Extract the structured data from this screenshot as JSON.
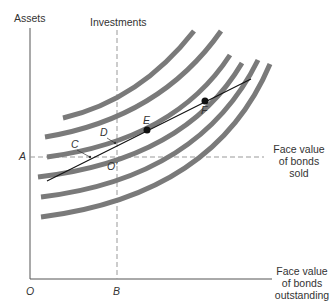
{
  "diagram": {
    "y_axis_label": "Assets",
    "investments_label": "Investments",
    "x_axis_label_lines": [
      "Face value",
      "of bonds",
      "outstanding"
    ],
    "sold_label_lines": [
      "Face value",
      "of bonds",
      "sold"
    ],
    "origin_label": "O",
    "a_label": "A",
    "b_label": "B",
    "o_prime_label": "O'",
    "points": {
      "C": "C",
      "D": "D",
      "E": "E",
      "F": "F"
    },
    "curve_count": 6,
    "colors": {
      "curve": "#7a7a7a",
      "line": "#111111",
      "axis": "#555555",
      "dashed": "#999999"
    }
  }
}
